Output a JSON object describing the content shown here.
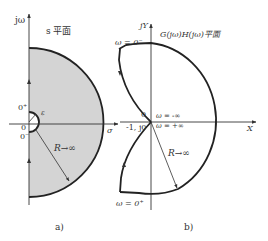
{
  "figure_a": {
    "caption": "a)",
    "plane_title": "s 平面",
    "y_axis_label": "jω",
    "x_axis_label": "σ",
    "origin_label": "0",
    "zero_plus_label": "0⁺",
    "zero_minus_label": "0⁻",
    "epsilon_label": "ε",
    "radius_label": "R→∞",
    "fill_color": "#d4d4d4",
    "stroke_color": "#222222"
  },
  "figure_b": {
    "caption": "b)",
    "plane_title": "G(jω)H(jω)平面",
    "y_axis_label": "jY",
    "x_axis_label": "X",
    "origin_label": "0",
    "critical_point_label": "-1, j0",
    "omega_minus_zero_label": "ω = 0⁻",
    "omega_plus_zero_label": "ω = 0⁺",
    "omega_minus_inf_label": "ω = -∞",
    "omega_plus_inf_label": "ω = +∞",
    "radius_label": "R→∞",
    "stroke_color": "#222222"
  }
}
